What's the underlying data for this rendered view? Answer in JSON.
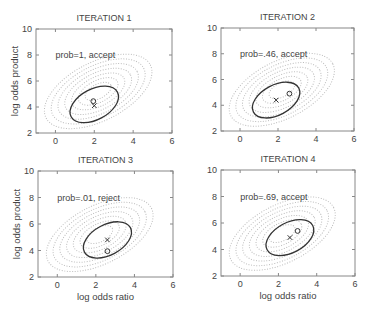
{
  "figure": {
    "xlabel": "log odds ratio",
    "ylabel": "log odds product"
  },
  "chart_data": [
    {
      "type": "scatter",
      "title": "ITERATION 1",
      "annotation": "prob=1, accept",
      "xlabel": "",
      "ylabel": "log odds product",
      "xlim": [
        -1,
        6
      ],
      "ylim": [
        2,
        10
      ],
      "xticks": [
        0,
        2,
        4,
        6
      ],
      "yticks": [
        2,
        4,
        6,
        8,
        10
      ],
      "grid": false,
      "frame": {
        "x0": 36,
        "y0": 29,
        "x1": 172,
        "y1": 133
      },
      "target_contours_center": [
        2.2,
        5.2
      ],
      "proposal_ellipse": {
        "cx": 2.0,
        "cy": 4.2,
        "rx": 1.35,
        "ry": 0.75,
        "angle_deg": 28
      },
      "current_point_x": [
        2.0,
        4.1
      ],
      "proposed_point_o": [
        1.95,
        4.45
      ]
    },
    {
      "type": "scatter",
      "title": "ITERATION 2",
      "annotation": "prob=.46, accept",
      "xlabel": "",
      "ylabel": "",
      "xlim": [
        -1,
        6
      ],
      "ylim": [
        2,
        10
      ],
      "xticks": [
        0,
        2,
        4,
        6
      ],
      "yticks": [
        2,
        4,
        6,
        8,
        10
      ],
      "grid": false,
      "frame": {
        "x0": 221,
        "y0": 28,
        "x1": 354,
        "y1": 131
      },
      "target_contours_center": [
        2.2,
        5.2
      ],
      "proposal_ellipse": {
        "cx": 1.9,
        "cy": 4.4,
        "rx": 1.35,
        "ry": 0.75,
        "angle_deg": 28
      },
      "current_point_x": [
        1.9,
        4.4
      ],
      "proposed_point_o": [
        2.6,
        4.9
      ]
    },
    {
      "type": "scatter",
      "title": "ITERATION 3",
      "annotation": "prob=.01, reject",
      "xlabel": "log odds ratio",
      "ylabel": "log odds product",
      "xlim": [
        -1,
        6
      ],
      "ylim": [
        2,
        10
      ],
      "xticks": [
        0,
        2,
        4,
        6
      ],
      "yticks": [
        2,
        4,
        6,
        8,
        10
      ],
      "grid": false,
      "frame": {
        "x0": 38,
        "y0": 171,
        "x1": 173,
        "y1": 277
      },
      "target_contours_center": [
        2.2,
        5.2
      ],
      "proposal_ellipse": {
        "cx": 2.6,
        "cy": 4.8,
        "rx": 1.35,
        "ry": 0.75,
        "angle_deg": 28
      },
      "current_point_x": [
        2.6,
        4.8
      ],
      "proposed_point_o": [
        2.6,
        3.95
      ]
    },
    {
      "type": "scatter",
      "title": "ITERATION 4",
      "annotation": "prob=.69, accept",
      "xlabel": "log odds ratio",
      "ylabel": "",
      "xlim": [
        -1,
        6
      ],
      "ylim": [
        2,
        10
      ],
      "xticks": [
        0,
        2,
        4,
        6
      ],
      "yticks": [
        2,
        4,
        6,
        8,
        10
      ],
      "grid": false,
      "frame": {
        "x0": 221,
        "y0": 170,
        "x1": 355,
        "y1": 276
      },
      "target_contours_center": [
        2.2,
        5.2
      ],
      "proposal_ellipse": {
        "cx": 2.6,
        "cy": 4.9,
        "rx": 1.35,
        "ry": 0.75,
        "angle_deg": 28
      },
      "current_point_x": [
        2.6,
        4.9
      ],
      "proposed_point_o": [
        3.0,
        5.4
      ]
    }
  ],
  "colors": {
    "frame": "#888888",
    "contour": "#bdbdbd",
    "ellipse": "#333333",
    "marker": "#333333",
    "text": "#444444"
  }
}
